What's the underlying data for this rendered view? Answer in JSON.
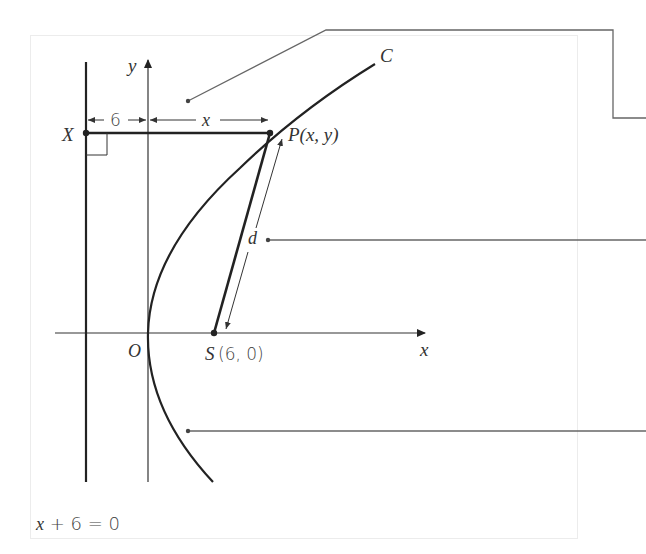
{
  "diagram": {
    "labels": {
      "y_axis": "y",
      "x_axis": "x",
      "origin": "O",
      "curve": "C",
      "point_P": "P(x, y)",
      "point_X": "X",
      "focus_S_letter": "S",
      "focus_S_coords": "(6, 0)",
      "distance_d": "d",
      "dim_six": "6",
      "dim_x": "x",
      "directrix_eq_var": "x",
      "directrix_eq_rest": " + 6 = 0"
    },
    "points": {
      "origin": [
        148,
        333
      ],
      "focus_S": [
        214,
        333
      ],
      "point_P": [
        270,
        133
      ],
      "point_X": [
        86,
        133
      ]
    },
    "callouts": [
      {
        "name": "callout-top",
        "dot": [
          188,
          101
        ]
      },
      {
        "name": "callout-d",
        "dot": [
          268,
          240
        ]
      },
      {
        "name": "callout-bottom",
        "dot": [
          188,
          431
        ]
      }
    ],
    "colors": {
      "stroke": "#222222",
      "callout": "#666666",
      "frame": "#ececec",
      "text": "#333333"
    }
  }
}
